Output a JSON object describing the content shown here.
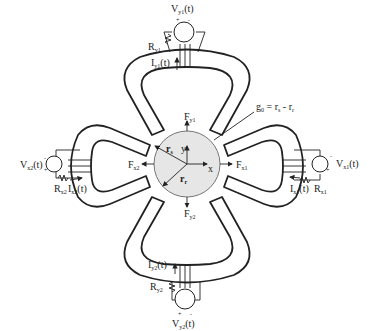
{
  "diagram": {
    "type": "magnetic-bearing-schematic",
    "rotor": {
      "axis_x": "x",
      "axis_y": "y",
      "radius_outer_label": "r",
      "radius_outer_sub": "s",
      "radius_rotor_label": "r",
      "radius_rotor_sub": "r",
      "fill": "#e6e6e6"
    },
    "gap_equation": {
      "g": "g",
      "g_sub": "0",
      "eq": " = r",
      "s_sub": "s",
      "minus": " - r",
      "r_sub": "r"
    },
    "magnets": {
      "top": {
        "voltage": "V",
        "voltage_sub": "y1",
        "voltage_suffix": "(t)",
        "resistor": "R",
        "resistor_sub": "y1",
        "current": "I",
        "current_sub": "y1",
        "current_suffix": "(t)",
        "force": "F",
        "force_sub": "y1",
        "plus": "+",
        "minus": "-"
      },
      "bottom": {
        "voltage": "V",
        "voltage_sub": "y2",
        "voltage_suffix": "(t)",
        "resistor": "R",
        "resistor_sub": "y2",
        "current": "I",
        "current_sub": "y2",
        "current_suffix": "(t)",
        "force": "F",
        "force_sub": "y2",
        "plus": "+",
        "minus": "-"
      },
      "left": {
        "voltage": "V",
        "voltage_sub": "x2",
        "voltage_suffix": "(t)",
        "resistor": "R",
        "resistor_sub": "x2",
        "current": "I",
        "current_sub": "x2",
        "current_suffix": "(t)",
        "force": "F",
        "force_sub": "x2",
        "plus": "+",
        "minus": "-"
      },
      "right": {
        "voltage": "V",
        "voltage_sub": "x1",
        "voltage_suffix": "(t)",
        "resistor": "R",
        "resistor_sub": "x1",
        "current": "I",
        "current_sub": "x1",
        "current_suffix": "(t)",
        "force": "F",
        "force_sub": "x1",
        "plus": "+",
        "minus": "-"
      }
    }
  }
}
